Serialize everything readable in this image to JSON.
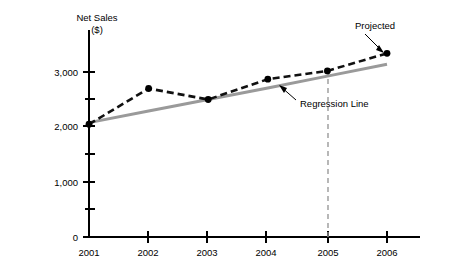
{
  "chart_data": {
    "type": "line",
    "title": "",
    "ylabel": "Net Sales",
    "ylabel_units": "($)",
    "xlabel": "",
    "categories": [
      "2001",
      "2002",
      "2003",
      "2004",
      "2005",
      "2006"
    ],
    "x": [
      2001,
      2002,
      2003,
      2004,
      2005,
      2006
    ],
    "ylim": [
      0,
      3400
    ],
    "xlim": [
      2001,
      2006
    ],
    "grid": false,
    "legend_position": "none",
    "y_tick_labels": [
      "0",
      "1,000",
      "2,000",
      "3,000"
    ],
    "y_tick_values": [
      0,
      1000,
      2000,
      3000
    ],
    "y_minor_tick_values": [
      500,
      1500,
      2500
    ],
    "x_tick_labels": [
      "2001",
      "2002",
      "2003",
      "2004",
      "2005",
      "2006"
    ],
    "series": [
      {
        "name": "Net Sales",
        "style": "dashed-black-with-markers",
        "color": "#111111",
        "values": [
          2050,
          2700,
          2500,
          2870,
          3020,
          3340
        ],
        "projected_from_index": 4
      },
      {
        "name": "Regression Line",
        "style": "solid-gray",
        "color": "#9a9a9a",
        "values": [
          2080,
          2290,
          2500,
          2710,
          2925,
          3140
        ]
      }
    ],
    "annotations": [
      {
        "name": "projected",
        "label": "Projected",
        "points_to_x": 2006,
        "points_to_y": 3340
      },
      {
        "name": "regression-line",
        "label": "Regression Line",
        "points_to_x": 2004.4,
        "points_to_y": 2800
      }
    ],
    "reference_lines": [
      {
        "name": "projection-divider",
        "orientation": "vertical",
        "at_x": 2005,
        "style": "dashed-gray"
      }
    ]
  },
  "labels": {
    "y_axis_title_line1": "Net Sales",
    "y_axis_title_line2": "($)",
    "annot_projected": "Projected",
    "annot_regression": "Regression Line",
    "y0": "0",
    "y1000": "1,000",
    "y2000": "2,000",
    "y3000": "3,000",
    "x2001": "2001",
    "x2002": "2002",
    "x2003": "2003",
    "x2004": "2004",
    "x2005": "2005",
    "x2006": "2006"
  },
  "colors": {
    "background": "#ffffff",
    "axis": "#000000",
    "regression": "#9a9a9a",
    "actual": "#111111",
    "divider": "#9a9a9a"
  }
}
